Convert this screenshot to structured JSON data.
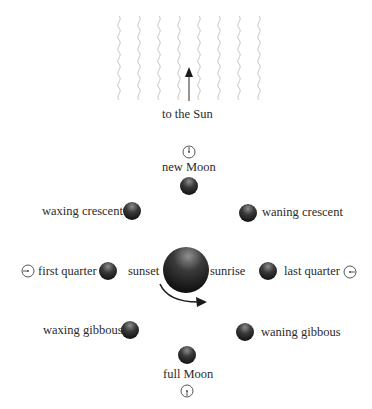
{
  "diagram": {
    "sun_label": "to the Sun",
    "earth": {
      "left_label": "sunset",
      "right_label": "sunrise"
    },
    "phases": [
      {
        "id": "new",
        "label": "new Moon",
        "observer_clock": "noon"
      },
      {
        "id": "waxing-crescent",
        "label": "waxing crescent"
      },
      {
        "id": "waning-crescent",
        "label": "waning crescent"
      },
      {
        "id": "first-quarter",
        "label": "first quarter",
        "observer_clock": "6pm"
      },
      {
        "id": "last-quarter",
        "label": "last quarter",
        "observer_clock": "6am"
      },
      {
        "id": "waxing-gibbous",
        "label": "waxing gibbous"
      },
      {
        "id": "waning-gibbous",
        "label": "waning gibbous"
      },
      {
        "id": "full",
        "label": "full Moon",
        "observer_clock": "midnight"
      }
    ],
    "colors": {
      "moon_dark": "#1e1e1e",
      "moon_light": "#8a8a8a",
      "sun_rays": "#c8c8c8",
      "arrow": "#2a2a2a"
    }
  }
}
